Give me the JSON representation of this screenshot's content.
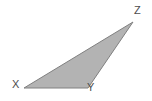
{
  "figure": {
    "kind": "geometry-diagram",
    "shape": "triangle",
    "background_color": "#ffffff",
    "fill_color": "#b3b3b3",
    "stroke_color": "#808080",
    "stroke_width": 1,
    "label_color": "#4d4d4d",
    "vertices": [
      {
        "id": "x",
        "label": "X",
        "x": 24,
        "y": 88,
        "label_x": 12,
        "label_y": 79
      },
      {
        "id": "y",
        "label": "Y",
        "x": 88,
        "y": 88,
        "label_x": 87,
        "label_y": 82
      },
      {
        "id": "z",
        "label": "Z",
        "x": 133,
        "y": 22,
        "label_x": 134,
        "label_y": 5
      }
    ],
    "edges": [
      {
        "id": "xy",
        "from": "X",
        "to": "Y"
      },
      {
        "id": "yz",
        "from": "Y",
        "to": "Z"
      },
      {
        "id": "zx",
        "from": "Z",
        "to": "X"
      }
    ],
    "polygon_points": "24,88 88,88 133,22"
  }
}
